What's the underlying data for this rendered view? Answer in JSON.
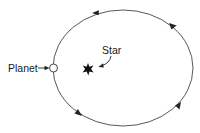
{
  "diagram": {
    "type": "orbit",
    "labels": {
      "planet": "Planet",
      "star": "Star"
    },
    "orbit": {
      "shape": "ellipse",
      "direction": "counter-clockwise",
      "center": [
        123,
        68
      ],
      "rx": 70,
      "ry": 58
    },
    "colors": {
      "line": "#333333",
      "star": "#111111",
      "planet_fill": "#ffffff"
    },
    "icons": {
      "planet": "circle-icon",
      "star": "star-icon"
    }
  }
}
